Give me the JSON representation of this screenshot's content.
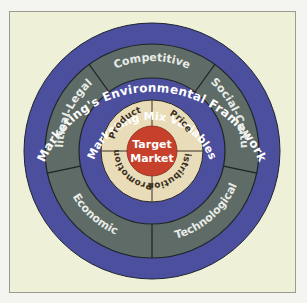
{
  "colors": {
    "page_bg": "#f4f4f0",
    "frame_bg": "#eef0d8",
    "frame_border": "#9a9a90",
    "outer_band": "#4b4f9e",
    "environment_ring": "#5f6b67",
    "mix_band": "#4b4f9e",
    "mix_ring": "#e9dcb9",
    "center": "#c6402b",
    "divider": "#1e2424",
    "band_text": "#ffffff",
    "env_text": "#e8ece6",
    "mix_text": "#3a3022",
    "center_text": "#ffffff"
  },
  "outer_band": {
    "label": "Marketing's Environmental Framework"
  },
  "environment": {
    "segments": [
      {
        "label": "Competitive"
      },
      {
        "label": "Social-Cultural"
      },
      {
        "label": "Technological"
      },
      {
        "label": "Economic"
      },
      {
        "label": "Political-Legal"
      }
    ]
  },
  "mix_band": {
    "label": "Marketing Mix Variables"
  },
  "mix": {
    "segments": [
      {
        "label": "Product"
      },
      {
        "label": "Price"
      },
      {
        "label": "Distribution"
      },
      {
        "label": "Promotion"
      }
    ]
  },
  "center": {
    "line1": "Target",
    "line2": "Market"
  }
}
